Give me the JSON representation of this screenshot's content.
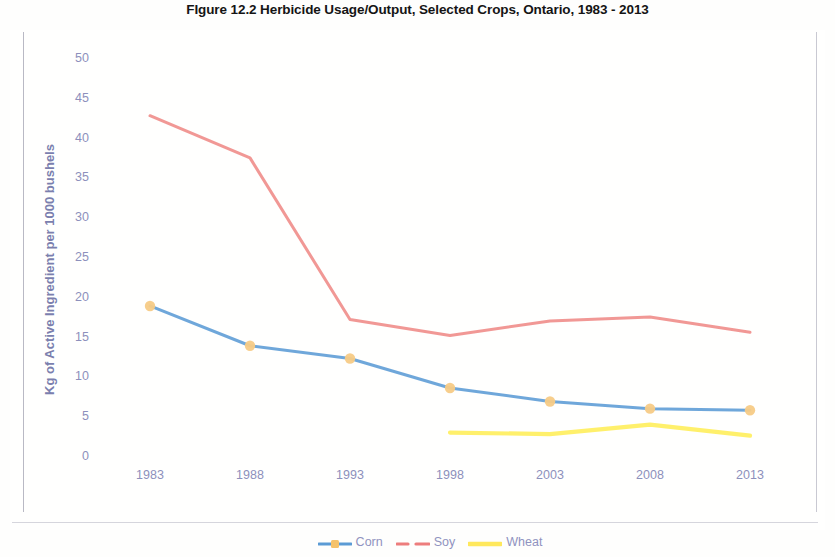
{
  "title": "FIgure 12.2 Herbicide Usage/Output, Selected Crops, Ontario, 1983 - 2013",
  "axis": {
    "y_title": "Kg of Active Ingredient per 1000 bushels"
  },
  "legend": {
    "items": [
      {
        "label": "Corn",
        "color": "#5b9bd5",
        "marker_color": "#f5c26b"
      },
      {
        "label": "Soy",
        "color": "#ed7d7d",
        "marker_color": "#ed7d7d"
      },
      {
        "label": "Wheat",
        "color": "#ffe85c",
        "marker_color": "#ffe85c"
      }
    ]
  },
  "colors": {
    "corn_line": "#5b9bd5",
    "corn_marker": "#f7cb86",
    "soy_line": "#ef8a86",
    "wheat_line": "#ffef63",
    "tick_text": "#8d90bc",
    "axis_title": "#7b7fae",
    "title_text": "#151515"
  },
  "chart_data": {
    "type": "line",
    "title": "FIgure 12.2 Herbicide Usage/Output, Selected Crops, Ontario, 1983 - 2013",
    "xlabel": "",
    "ylabel": "Kg of Active Ingredient per 1000 bushels",
    "categories": [
      "1983",
      "1988",
      "1993",
      "1998",
      "2003",
      "2008",
      "2013"
    ],
    "ylim": [
      0,
      50
    ],
    "yticks": [
      0,
      5,
      10,
      15,
      20,
      25,
      30,
      35,
      40,
      45,
      50
    ],
    "grid": false,
    "legend_position": "bottom",
    "series": [
      {
        "name": "Corn",
        "color": "#5b9bd5",
        "markers": true,
        "values": [
          19.1,
          14.1,
          12.5,
          8.8,
          7.1,
          6.2,
          6.0
        ]
      },
      {
        "name": "Soy",
        "color": "#ef8a86",
        "markers": false,
        "values": [
          43.0,
          37.7,
          17.4,
          15.4,
          17.2,
          17.7,
          15.8
        ]
      },
      {
        "name": "Wheat",
        "color": "#ffef63",
        "markers": false,
        "values": [
          null,
          null,
          null,
          3.2,
          3.0,
          4.2,
          2.8
        ]
      }
    ]
  }
}
